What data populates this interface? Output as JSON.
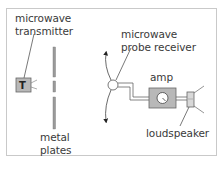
{
  "diagram": {
    "labels": {
      "transmitter_line1": "microwave",
      "transmitter_line2": "transmitter",
      "transmitter_box": "T",
      "plates_line1": "metal",
      "plates_line2": "plates",
      "receiver_line1": "microwave",
      "receiver_line2": "probe receiver",
      "amp": "amp",
      "loudspeaker": "loudspeaker"
    },
    "colors": {
      "frame": "#c9c9c9",
      "line": "#555555",
      "box_fill": "#b8b8b8",
      "plate_fill": "#9a9a9a",
      "text": "#3a3a3a"
    }
  }
}
